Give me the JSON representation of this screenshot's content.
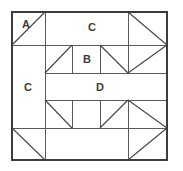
{
  "diagram": {
    "canvas": {
      "width": 183,
      "height": 171
    },
    "colors": {
      "background": "#ffffff",
      "line": "#5a5a5a",
      "outer_border": "#3c3c3c",
      "label_text": "#3a3a3a"
    },
    "grid": {
      "x_lines": [
        12,
        45,
        72,
        100,
        128,
        167
      ],
      "y_lines": [
        12,
        45,
        73,
        100,
        128,
        160
      ],
      "unit": 27.6
    },
    "labels": [
      {
        "id": "label-a",
        "text": "A",
        "x": 26,
        "y": 24
      },
      {
        "id": "label-c-top",
        "text": "C",
        "x": 92,
        "y": 27
      },
      {
        "id": "label-b",
        "text": "B",
        "x": 87,
        "y": 59
      },
      {
        "id": "label-c-left",
        "text": "C",
        "x": 28,
        "y": 87
      },
      {
        "id": "label-d",
        "text": "D",
        "x": 100,
        "y": 87
      }
    ],
    "patches": [
      {
        "id": "patch-a",
        "label": "A",
        "kind": "half-square-triangle",
        "position": "top-left-corner"
      },
      {
        "id": "patch-c-top",
        "label": "C",
        "kind": "rectangle-strip",
        "position": "top-band"
      },
      {
        "id": "patch-b",
        "label": "B",
        "kind": "square",
        "position": "middle-upper-band"
      },
      {
        "id": "patch-c-left",
        "label": "C",
        "kind": "rectangle-strip",
        "position": "left-band"
      },
      {
        "id": "patch-d",
        "label": "D",
        "kind": "rectangle-strip",
        "position": "center-band"
      }
    ],
    "segments": [
      {
        "id": "outer-border",
        "type": "rect",
        "x1": 12,
        "y1": 12,
        "x2": 167,
        "y2": 160
      },
      {
        "id": "h-line-top-band",
        "type": "line",
        "x1": 12,
        "y1": 45,
        "x2": 167,
        "y2": 45
      },
      {
        "id": "h-line-b-bottom",
        "type": "line",
        "x1": 45,
        "y1": 73,
        "x2": 167,
        "y2": 73
      },
      {
        "id": "h-line-d-top",
        "type": "line",
        "x1": 45,
        "y1": 100,
        "x2": 167,
        "y2": 100
      },
      {
        "id": "h-line-d-bottom",
        "type": "line",
        "x1": 12,
        "y1": 128,
        "x2": 167,
        "y2": 128
      },
      {
        "id": "v-line-col1",
        "type": "line",
        "x1": 45,
        "y1": 12,
        "x2": 45,
        "y2": 160
      },
      {
        "id": "v-line-col2-upper",
        "type": "line",
        "x1": 72,
        "y1": 45,
        "x2": 72,
        "y2": 73
      },
      {
        "id": "v-line-col3-upper",
        "type": "line",
        "x1": 100,
        "y1": 45,
        "x2": 100,
        "y2": 73
      },
      {
        "id": "v-line-col4-upper",
        "type": "line",
        "x1": 128,
        "y1": 12,
        "x2": 128,
        "y2": 73
      },
      {
        "id": "v-line-col2-lower",
        "type": "line",
        "x1": 72,
        "y1": 100,
        "x2": 72,
        "y2": 128
      },
      {
        "id": "v-line-col3-lower",
        "type": "line",
        "x1": 100,
        "y1": 100,
        "x2": 100,
        "y2": 128
      },
      {
        "id": "v-line-col4-lower",
        "type": "line",
        "x1": 128,
        "y1": 100,
        "x2": 128,
        "y2": 160
      },
      {
        "id": "diag-a",
        "type": "line",
        "x1": 12,
        "y1": 45,
        "x2": 45,
        "y2": 12
      },
      {
        "id": "diag-top-right",
        "type": "line",
        "x1": 128,
        "y1": 12,
        "x2": 167,
        "y2": 45
      },
      {
        "id": "diag-b-left",
        "type": "line",
        "x1": 45,
        "y1": 73,
        "x2": 72,
        "y2": 45
      },
      {
        "id": "diag-v-left",
        "type": "line",
        "x1": 100,
        "y1": 45,
        "x2": 128,
        "y2": 73
      },
      {
        "id": "diag-v-right",
        "type": "line",
        "x1": 128,
        "y1": 73,
        "x2": 167,
        "y2": 45
      },
      {
        "id": "diag-lower-left",
        "type": "line",
        "x1": 45,
        "y1": 100,
        "x2": 72,
        "y2": 128
      },
      {
        "id": "diag-peak-left",
        "type": "line",
        "x1": 100,
        "y1": 128,
        "x2": 128,
        "y2": 100
      },
      {
        "id": "diag-peak-right",
        "type": "line",
        "x1": 128,
        "y1": 100,
        "x2": 167,
        "y2": 128
      },
      {
        "id": "diag-bottom-left",
        "type": "line",
        "x1": 12,
        "y1": 128,
        "x2": 45,
        "y2": 160
      },
      {
        "id": "diag-bottom-right",
        "type": "line",
        "x1": 128,
        "y1": 160,
        "x2": 167,
        "y2": 128
      }
    ]
  }
}
